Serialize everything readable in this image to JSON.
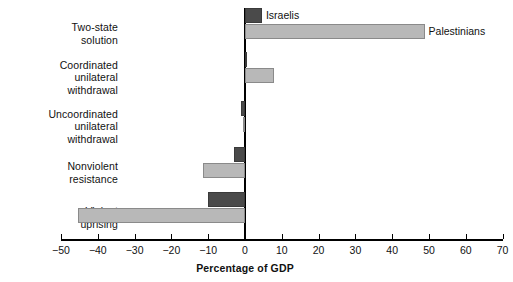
{
  "chart_data": {
    "type": "bar",
    "orientation": "horizontal",
    "title": "",
    "xlabel": "Percentage of GDP",
    "ylabel": "",
    "xlim": [
      -50,
      70
    ],
    "xticks": [
      -50,
      -40,
      -30,
      -20,
      -10,
      0,
      10,
      20,
      30,
      40,
      50,
      60,
      70
    ],
    "xtick_labels": [
      "−50",
      "−40",
      "−30",
      "−20",
      "−10",
      "0",
      "10",
      "20",
      "30",
      "40",
      "50",
      "60",
      "70"
    ],
    "grid": false,
    "legend_position": "inline-annotation",
    "categories": [
      "Two-state\nsolution",
      "Coordinated\nunilateral\nwithdrawal",
      "Uncoordinated\nunilateral\nwithdrawal",
      "Nonviolent\nresistance",
      "Violent\nuprising"
    ],
    "series": [
      {
        "name": "Israelis",
        "color": "#4a4a4a",
        "values": [
          4.6,
          0.0,
          -1.2,
          -3.0,
          -10.0
        ]
      },
      {
        "name": "Palestinians",
        "color": "#b8b8b8",
        "values": [
          48.8,
          7.9,
          -0.5,
          -11.4,
          -45.4
        ]
      }
    ],
    "annotations": [
      {
        "text": "Israelis",
        "series": "Israelis",
        "category_index": 0
      },
      {
        "text": "Palestinians",
        "series": "Palestinians",
        "category_index": 0
      }
    ]
  },
  "colors": {
    "israelis": "#4a4a4a",
    "palestinians": "#b8b8b8",
    "axis": "#000000",
    "text": "#111111",
    "background": "#ffffff"
  }
}
